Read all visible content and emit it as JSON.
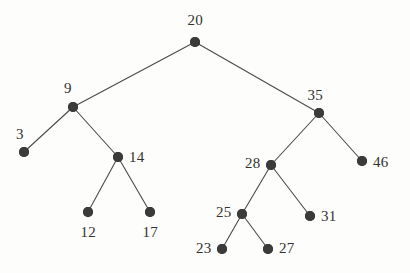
{
  "figure": {
    "name": "binary-search-tree-diagram",
    "background_color": "#fdfdfc",
    "node_color": "#3b3b3b",
    "edge_color": "#4a4a48",
    "label_color": "#33322f",
    "width": 410,
    "height": 273
  },
  "chart_data": {
    "type": "diagram",
    "diagram_type": "binary-search-tree",
    "title": "",
    "root": "20",
    "node_radius": 5,
    "label_font_size": 15,
    "nodes": [
      {
        "id": "n20",
        "label": "20",
        "x": 195,
        "y": 42,
        "label_pos": "top",
        "label_x": 195,
        "label_y": 20
      },
      {
        "id": "n9",
        "label": "9",
        "x": 73,
        "y": 107,
        "label_pos": "top-left",
        "label_x": 68,
        "label_y": 88
      },
      {
        "id": "n35",
        "label": "35",
        "x": 319,
        "y": 113,
        "label_pos": "top-left",
        "label_x": 315,
        "label_y": 95
      },
      {
        "id": "n3",
        "label": "3",
        "x": 24,
        "y": 152,
        "label_pos": "top-left",
        "label_x": 20,
        "label_y": 134
      },
      {
        "id": "n14",
        "label": "14",
        "x": 118,
        "y": 157,
        "label_pos": "right",
        "label_x": 129,
        "label_y": 157
      },
      {
        "id": "n28",
        "label": "28",
        "x": 271,
        "y": 165,
        "label_pos": "left",
        "label_x": 260,
        "label_y": 163
      },
      {
        "id": "n46",
        "label": "46",
        "x": 362,
        "y": 161,
        "label_pos": "right",
        "label_x": 373,
        "label_y": 162
      },
      {
        "id": "n12",
        "label": "12",
        "x": 88,
        "y": 212,
        "label_pos": "bottom",
        "label_x": 88,
        "label_y": 232
      },
      {
        "id": "n17",
        "label": "17",
        "x": 150,
        "y": 212,
        "label_pos": "bottom",
        "label_x": 150,
        "label_y": 232
      },
      {
        "id": "n25",
        "label": "25",
        "x": 242,
        "y": 214,
        "label_pos": "left",
        "label_x": 231,
        "label_y": 212
      },
      {
        "id": "n31",
        "label": "31",
        "x": 310,
        "y": 216,
        "label_pos": "right",
        "label_x": 321,
        "label_y": 216
      },
      {
        "id": "n23",
        "label": "23",
        "x": 222,
        "y": 249,
        "label_pos": "left",
        "label_x": 211,
        "label_y": 248
      },
      {
        "id": "n27",
        "label": "27",
        "x": 268,
        "y": 249,
        "label_pos": "right",
        "label_x": 279,
        "label_y": 248
      }
    ],
    "edges": [
      {
        "from": "n20",
        "to": "n9",
        "side": "left"
      },
      {
        "from": "n20",
        "to": "n35",
        "side": "right"
      },
      {
        "from": "n9",
        "to": "n3",
        "side": "left"
      },
      {
        "from": "n9",
        "to": "n14",
        "side": "right"
      },
      {
        "from": "n14",
        "to": "n12",
        "side": "left"
      },
      {
        "from": "n14",
        "to": "n17",
        "side": "right"
      },
      {
        "from": "n35",
        "to": "n28",
        "side": "left"
      },
      {
        "from": "n35",
        "to": "n46",
        "side": "right"
      },
      {
        "from": "n28",
        "to": "n25",
        "side": "left"
      },
      {
        "from": "n28",
        "to": "n31",
        "side": "right"
      },
      {
        "from": "n25",
        "to": "n23",
        "side": "left"
      },
      {
        "from": "n25",
        "to": "n27",
        "side": "right"
      }
    ],
    "values": [
      20,
      9,
      35,
      3,
      14,
      28,
      46,
      12,
      17,
      25,
      31,
      23,
      27
    ]
  }
}
